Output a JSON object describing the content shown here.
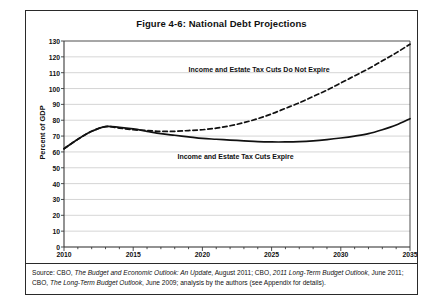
{
  "figure": {
    "title": "Figure 4-6: National Debt Projections",
    "source_line1_a": "Source: CBO, ",
    "source_line1_b": "The Budget and Economic Outlook: An Update",
    "source_line1_c": ", August 2011; CBO, ",
    "source_line1_d": "2011 Long-Term Budget Outlook",
    "source_line1_e": ", June 2011; CBO, ",
    "source_line2_a": "The Long-Term Budget Outlook",
    "source_line2_b": ", June 2009; analysis by the authors (see Appendix for details)."
  },
  "colors": {
    "line": "#111111",
    "grid": "#b9b9b9",
    "axis": "#3a3a3a",
    "frame": "#2a2a2a",
    "background": "#ffffff"
  },
  "chart_data": {
    "type": "line",
    "title": "Figure 4-6: National Debt Projections",
    "xlabel": "",
    "ylabel": "Percent of GDP",
    "xlim": [
      2010,
      2035
    ],
    "ylim": [
      0,
      130
    ],
    "ytick_step": 10,
    "yticks": [
      0,
      10,
      20,
      30,
      40,
      50,
      60,
      70,
      80,
      90,
      100,
      110,
      120,
      130
    ],
    "xticks": [
      2010,
      2015,
      2020,
      2025,
      2030,
      2035
    ],
    "xticks_minor_every": 1,
    "grid": true,
    "legend": "annotations-inline",
    "x": [
      2010,
      2011,
      2012,
      2013,
      2014,
      2015,
      2016,
      2017,
      2018,
      2019,
      2020,
      2021,
      2022,
      2023,
      2024,
      2025,
      2026,
      2027,
      2028,
      2029,
      2030,
      2031,
      2032,
      2033,
      2034,
      2035
    ],
    "series": [
      {
        "name": "Income and Estate Tax Cuts Do Not Expire",
        "style": "dashed",
        "annotation": "Income and Estate Tax Cuts Do Not Expire",
        "values": [
          62,
          68,
          73,
          76,
          75,
          74,
          73.5,
          73,
          73,
          73.5,
          74,
          75,
          76.5,
          78.5,
          81,
          84,
          87.5,
          91,
          95,
          99,
          103.5,
          108,
          112.5,
          117.5,
          122.5,
          128
        ]
      },
      {
        "name": "Income and Estate Tax Cuts Expire",
        "style": "solid",
        "annotation": "Income and Estate Tax Cuts Expire",
        "values": [
          62,
          68,
          73,
          76,
          75.5,
          74.5,
          73,
          71.5,
          70.5,
          69.5,
          68.5,
          68,
          67.5,
          67,
          66.5,
          66.3,
          66.3,
          66.5,
          67,
          67.8,
          68.8,
          70,
          71.5,
          74,
          77,
          81
        ]
      }
    ]
  },
  "annotations": {
    "upper": "Income and Estate Tax Cuts Do Not Expire",
    "lower": "Income and Estate Tax Cuts Expire"
  }
}
